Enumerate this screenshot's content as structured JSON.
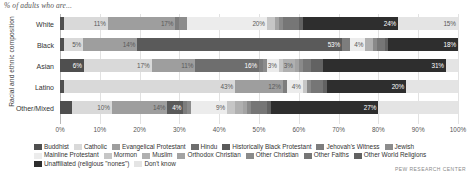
{
  "supertitle": "% of adults who are...",
  "yaxis_title": "Racial and ethnic composition",
  "source": "PEW RESEARCH CENTER",
  "xaxis": {
    "ticks": [
      "0%",
      "10%",
      "20%",
      "30%",
      "40%",
      "50%",
      "60%",
      "70%",
      "80%",
      "90%",
      "100%"
    ]
  },
  "legend": {
    "rows": [
      [
        {
          "label": "Buddhist",
          "color": "#4f4f4f"
        },
        {
          "label": "Catholic",
          "color": "#d9d9d9"
        },
        {
          "label": "Evangelical Protestant",
          "color": "#9e9e9e"
        },
        {
          "label": "Hindu",
          "color": "#6e6e6e"
        },
        {
          "label": "Historically Black Protestant",
          "color": "#5a5a5a"
        },
        {
          "label": "Jehovah's Witness",
          "color": "#7d7d7d"
        },
        {
          "label": "Jewish",
          "color": "#8c8c8c"
        }
      ],
      [
        {
          "label": "Mainline Protestant",
          "color": "#ececec"
        },
        {
          "label": "Mormon",
          "color": "#c6c6c6"
        },
        {
          "label": "Muslim",
          "color": "#b0b0b0"
        },
        {
          "label": "Orthodox Christian",
          "color": "#a3a3a3"
        },
        {
          "label": "Other Christian",
          "color": "#8a8a8a"
        },
        {
          "label": "Other Faiths",
          "color": "#767676"
        },
        {
          "label": "Other World Religions",
          "color": "#626262"
        }
      ],
      [
        {
          "label": "Unaffiliated (religious \"nones\")",
          "color": "#2e2e2e"
        },
        {
          "label": "Don't know",
          "color": "#e4e4e4"
        }
      ]
    ]
  },
  "chart_data": {
    "type": "bar",
    "orientation": "horizontal",
    "stacked": true,
    "normalized": true,
    "title": "% of adults who are...",
    "xlabel": "",
    "ylabel": "Racial and ethnic composition",
    "xlim": [
      0,
      100
    ],
    "grid": true,
    "legend_position": "bottom",
    "categories": [
      "White",
      "Black",
      "Asian",
      "Latino",
      "Other/Mixed"
    ],
    "series": [
      {
        "name": "Buddhist",
        "color": "#4f4f4f",
        "values": [
          1,
          1,
          6,
          1,
          3
        ]
      },
      {
        "name": "Catholic",
        "color": "#d9d9d9",
        "values": [
          11,
          5,
          17,
          43,
          10
        ]
      },
      {
        "name": "Evangelical Protestant",
        "color": "#9e9e9e",
        "values": [
          17,
          14,
          11,
          12,
          14
        ]
      },
      {
        "name": "Hindu",
        "color": "#6e6e6e",
        "values": [
          0,
          0,
          16,
          0,
          0
        ]
      },
      {
        "name": "Historically Black Protestant",
        "color": "#5a5a5a",
        "values": [
          0,
          53,
          0,
          0,
          4
        ]
      },
      {
        "name": "Jehovah's Witness",
        "color": "#7d7d7d",
        "values": [
          1,
          2,
          1,
          1,
          1
        ]
      },
      {
        "name": "Jewish",
        "color": "#8c8c8c",
        "values": [
          2,
          0,
          1,
          0,
          1
        ]
      },
      {
        "name": "Mainline Protestant",
        "color": "#ececec",
        "values": [
          20,
          4,
          3,
          4,
          9
        ]
      },
      {
        "name": "Mormon",
        "color": "#c6c6c6",
        "values": [
          2,
          0,
          1,
          1,
          2
        ]
      },
      {
        "name": "Muslim",
        "color": "#b0b0b0",
        "values": [
          0,
          2,
          3,
          0,
          2
        ]
      },
      {
        "name": "Orthodox Christian",
        "color": "#a3a3a3",
        "values": [
          1,
          0,
          1,
          0,
          1
        ]
      },
      {
        "name": "Other Christian",
        "color": "#8a8a8a",
        "values": [
          1,
          1,
          1,
          1,
          1
        ]
      },
      {
        "name": "Other Faiths",
        "color": "#767676",
        "values": [
          4,
          2,
          2,
          3,
          4
        ]
      },
      {
        "name": "Other World Religions",
        "color": "#626262",
        "values": [
          1,
          1,
          3,
          1,
          1
        ]
      },
      {
        "name": "Unaffiliated (religious \"nones\")",
        "color": "#2e2e2e",
        "values": [
          24,
          18,
          31,
          20,
          27
        ]
      },
      {
        "name": "Don't know",
        "color": "#e4e4e4",
        "values": [
          15,
          0,
          3,
          13,
          20
        ]
      }
    ],
    "value_labels": {
      "White": [
        {
          "series": "Catholic",
          "text": "11%"
        },
        {
          "series": "Evangelical Protestant",
          "text": "17%"
        },
        {
          "series": "Mainline Protestant",
          "text": "20%"
        },
        {
          "series": "Don't know",
          "text": "15%"
        },
        {
          "series": "Unaffiliated (religious \"nones\")",
          "text": "24%"
        }
      ],
      "Black": [
        {
          "series": "Catholic",
          "text": "5%"
        },
        {
          "series": "Evangelical Protestant",
          "text": "14%"
        },
        {
          "series": "Historically Black Protestant",
          "text": "53%"
        },
        {
          "series": "Mainline Protestant",
          "text": "4%"
        },
        {
          "series": "Unaffiliated (religious \"nones\")",
          "text": "18%"
        }
      ],
      "Asian": [
        {
          "series": "Buddhist",
          "text": "6%"
        },
        {
          "series": "Catholic",
          "text": "17%"
        },
        {
          "series": "Evangelical Protestant",
          "text": "11%"
        },
        {
          "series": "Hindu",
          "text": "16%"
        },
        {
          "series": "Mainline Protestant",
          "text": "3%"
        },
        {
          "series": "Muslim",
          "text": "3%"
        },
        {
          "series": "Unaffiliated (religious \"nones\")",
          "text": "31%"
        }
      ],
      "Latino": [
        {
          "series": "Catholic",
          "text": "43%"
        },
        {
          "series": "Evangelical Protestant",
          "text": "12%"
        },
        {
          "series": "Mainline Protestant",
          "text": "4%"
        },
        {
          "series": "Unaffiliated (religious \"nones\")",
          "text": "20%"
        }
      ],
      "Other/Mixed": [
        {
          "series": "Catholic",
          "text": "10%"
        },
        {
          "series": "Evangelical Protestant",
          "text": "14%"
        },
        {
          "series": "Mainline Protestant",
          "text": "9%"
        },
        {
          "series": "Historically Black Protestant",
          "text": "4%"
        },
        {
          "series": "Unaffiliated (religious \"nones\")",
          "text": "27%"
        }
      ]
    }
  }
}
